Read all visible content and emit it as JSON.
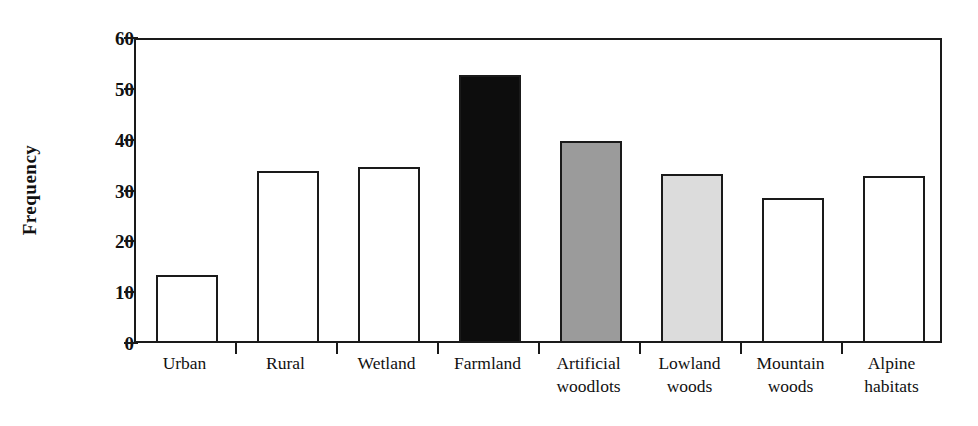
{
  "chart_data": {
    "type": "bar",
    "title": "",
    "xlabel": "",
    "ylabel": "Frequency",
    "ylim": [
      0,
      60
    ],
    "yticks": [
      0,
      10,
      20,
      30,
      40,
      50,
      60
    ],
    "grid": false,
    "legend": "none",
    "categories": [
      "Urban",
      "Rural",
      "Wetland",
      "Farmland",
      "Artificial woodlots",
      "Lowland woods",
      "Mountain woods",
      "Alpine habitats"
    ],
    "category_lines": [
      [
        "Urban",
        ""
      ],
      [
        "Rural",
        ""
      ],
      [
        "Wetland",
        ""
      ],
      [
        "Farmland",
        ""
      ],
      [
        "Artificial",
        "woodlots"
      ],
      [
        "Lowland",
        "woods"
      ],
      [
        "Mountain",
        "woods"
      ],
      [
        "Alpine",
        "habitats"
      ]
    ],
    "values": [
      13.0,
      33.4,
      34.2,
      52.3,
      39.4,
      32.8,
      28.1,
      32.5
    ],
    "bar_fills": [
      "#ffffff",
      "#ffffff",
      "#ffffff",
      "#0d0d0d",
      "#9b9b9b",
      "#dcdcdc",
      "#ffffff",
      "#ffffff"
    ],
    "bar_edge_color": "#1a1a1a",
    "axis_color": "#1a1a1a",
    "background": "#ffffff"
  },
  "layout": {
    "plot_left_px": 134,
    "plot_top_px": 38,
    "plot_width_px": 808,
    "plot_height_px": 305,
    "bar_width_px": 62,
    "slot_width_px": 101
  }
}
